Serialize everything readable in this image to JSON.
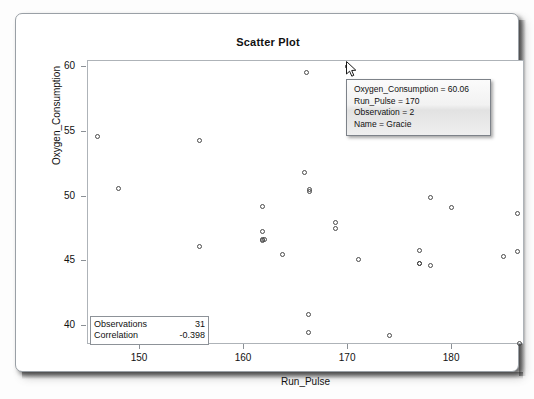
{
  "window": {
    "name": "scatter-plot-window"
  },
  "chart_data": {
    "type": "scatter",
    "title": "Scatter Plot",
    "xlabel": "Run_Pulse",
    "ylabel": "Oxygen_Consumption",
    "xlim": [
      145,
      187
    ],
    "ylim": [
      38.5,
      60.5
    ],
    "xticks": [
      150,
      160,
      170,
      180
    ],
    "yticks": [
      40,
      45,
      50,
      55,
      60
    ],
    "grid": false,
    "legend": "none",
    "marker": "open-circle",
    "points": [
      {
        "x": 146.0,
        "y": 54.62
      },
      {
        "x": 148.0,
        "y": 50.55
      },
      {
        "x": 155.8,
        "y": 54.3
      },
      {
        "x": 155.8,
        "y": 46.08
      },
      {
        "x": 161.8,
        "y": 49.16
      },
      {
        "x": 161.8,
        "y": 47.27
      },
      {
        "x": 161.8,
        "y": 46.67
      },
      {
        "x": 161.8,
        "y": 46.57
      },
      {
        "x": 163.7,
        "y": 45.44
      },
      {
        "x": 166.0,
        "y": 59.57
      },
      {
        "x": 165.9,
        "y": 51.85
      },
      {
        "x": 166.3,
        "y": 50.39
      },
      {
        "x": 166.3,
        "y": 50.54
      },
      {
        "x": 166.2,
        "y": 40.84
      },
      {
        "x": 166.2,
        "y": 39.44
      },
      {
        "x": 170.0,
        "y": 60.06
      },
      {
        "x": 168.8,
        "y": 47.92
      },
      {
        "x": 168.8,
        "y": 47.47
      },
      {
        "x": 171.0,
        "y": 45.12
      },
      {
        "x": 174.0,
        "y": 39.2
      },
      {
        "x": 176.9,
        "y": 45.79
      },
      {
        "x": 176.9,
        "y": 44.81
      },
      {
        "x": 176.9,
        "y": 44.75
      },
      {
        "x": 178.0,
        "y": 49.87
      },
      {
        "x": 178.0,
        "y": 44.61
      },
      {
        "x": 180.0,
        "y": 49.09
      },
      {
        "x": 185.0,
        "y": 45.31
      },
      {
        "x": 186.3,
        "y": 48.67
      },
      {
        "x": 186.3,
        "y": 45.68
      },
      {
        "x": 186.5,
        "y": 38.57
      },
      {
        "x": 162.0,
        "y": 46.67
      }
    ],
    "highlighted_point": {
      "x": 170,
      "y": 60.06
    }
  },
  "stats_box": {
    "name": "statistics-inset",
    "rows": [
      {
        "label": "Observations",
        "value": "31"
      },
      {
        "label": "Correlation",
        "value": "-0.398"
      }
    ]
  },
  "tooltip": {
    "visible": true,
    "lines": [
      "Oxygen_Consumption = 60.06",
      "Run_Pulse = 170",
      "Observation = 2",
      "Name = Gracie"
    ]
  }
}
